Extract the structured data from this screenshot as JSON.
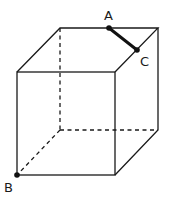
{
  "diagram": {
    "type": "cube",
    "labels": {
      "A": "A",
      "B": "B",
      "C": "C"
    },
    "vertices": {
      "front_top_left": [
        17,
        72
      ],
      "front_top_right": [
        115,
        72
      ],
      "front_bottom_left": [
        17,
        175
      ],
      "front_bottom_right": [
        115,
        175
      ],
      "back_top_left": [
        60,
        28
      ],
      "back_top_right": [
        158,
        28
      ],
      "back_bottom_left": [
        60,
        130
      ],
      "back_bottom_right": [
        158,
        130
      ]
    },
    "points": {
      "A": [
        109,
        28
      ],
      "B": [
        17,
        175
      ],
      "C": [
        137,
        50
      ]
    },
    "segments": [
      {
        "from": "A",
        "to": "C",
        "style": "bold"
      }
    ],
    "hidden_edges": [
      "back_top_left-back_bottom_left",
      "back_bottom_left-back_bottom_right",
      "back_bottom_left-front_bottom_left"
    ]
  }
}
